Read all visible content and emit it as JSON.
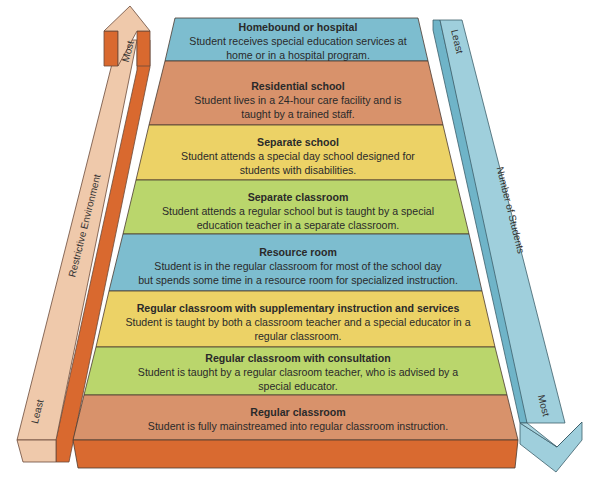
{
  "diagram": {
    "type": "pyramid-continuum",
    "layers": [
      {
        "title": "Homebound or hospital",
        "desc_line1": "Student receives special education services at",
        "desc_line2": "home or in a hospital program.",
        "color": "#7dbdcf"
      },
      {
        "title": "Residential school",
        "desc_line1": "Student lives in a 24-hour care facility and is",
        "desc_line2": "taught by a trained staff.",
        "color": "#d8926b"
      },
      {
        "title": "Separate school",
        "desc_line1": "Student attends a special day school designed for",
        "desc_line2": "students with disabilities.",
        "color": "#ecd266"
      },
      {
        "title": "Separate classroom",
        "desc_line1": "Student attends a regular school but is taught by a special",
        "desc_line2": "education teacher in a separate classroom.",
        "color": "#bad66c"
      },
      {
        "title": "Resource room",
        "desc_line1": "Student is in the regular classroom for most of the school day",
        "desc_line2": "but spends some time in a resource room for specialized instruction.",
        "color": "#7dbdcf"
      },
      {
        "title": "Regular classroom with supplementary instruction and services",
        "desc_line1": "Student is taught by both a classroom teacher and a special educator in a",
        "desc_line2": "regular classroom.",
        "color": "#ecd266"
      },
      {
        "title": "Regular classroom with consultation",
        "desc_line1": "Student is taught by a regular clasroom teacher, who is advised by a",
        "desc_line2": "special educator.",
        "color": "#bad66c"
      },
      {
        "title": "Regular classroom",
        "desc_line1": "Student is fully mainstreamed into regular classroom instruction.",
        "desc_line2": "",
        "color": "#d8926b"
      }
    ],
    "base_color": "#d96a30",
    "left_arrow": {
      "label": "Restrictive Environment",
      "top_label": "Most",
      "bottom_label": "Least",
      "color": "#efc9ab",
      "side_color": "#d9692f"
    },
    "right_arrow": {
      "label": "Number of Students",
      "top_label": "Least",
      "bottom_label": "Most",
      "color": "#9fcfdc",
      "side_color": "#6fb4c8"
    }
  }
}
